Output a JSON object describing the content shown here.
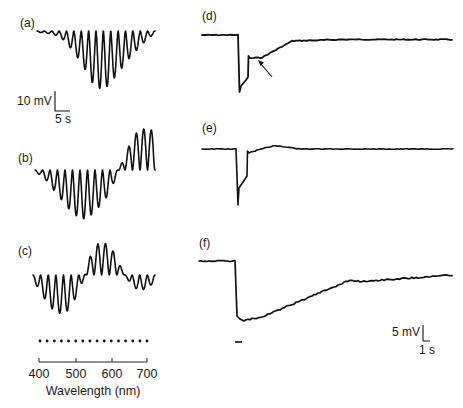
{
  "chart_data": [
    {
      "type": "line",
      "panel": "a",
      "title": "(a)",
      "description": "Membrane potential response to flashes of wavelength stepped 400-700 nm; hyperpolarizing responses peaking mid-spectrum",
      "xlabel": "Wavelength (nm)",
      "ylabel": "",
      "x": [
        400,
        420,
        440,
        460,
        480,
        500,
        520,
        540,
        560,
        580,
        600,
        620,
        640,
        660,
        680,
        700
      ],
      "values": [
        -0.5,
        -1,
        -1.5,
        -3,
        -7,
        -12,
        -18,
        -25,
        -28,
        -27,
        -22,
        -17,
        -12,
        -8,
        -4,
        -1
      ],
      "units": "mV"
    },
    {
      "type": "line",
      "panel": "b",
      "title": "(b)",
      "description": "Biphasic response: hyperpolarizing at short wavelengths, depolarizing at long wavelengths",
      "x": [
        400,
        420,
        440,
        460,
        480,
        500,
        520,
        540,
        560,
        580,
        600,
        620,
        640,
        660,
        680,
        700
      ],
      "values": [
        -1,
        -3,
        -8,
        -13,
        -18,
        -22,
        -24,
        -22,
        -18,
        -13,
        -5,
        5,
        14,
        20,
        20,
        19
      ],
      "units": "mV"
    },
    {
      "type": "line",
      "panel": "c",
      "title": "(c)",
      "description": "Triphasic response: hyperpolarizing (blue), depolarizing (green), hyperpolarizing (red)",
      "x": [
        400,
        420,
        440,
        460,
        480,
        500,
        520,
        540,
        560,
        580,
        600,
        620,
        640,
        660,
        680,
        700
      ],
      "values": [
        -2,
        -8,
        -14,
        -17,
        -17,
        -12,
        -4,
        8,
        14,
        14,
        10,
        2,
        -4,
        -7,
        -6,
        -3
      ],
      "units": "mV"
    },
    {
      "type": "line",
      "panel": "d",
      "title": "(d)",
      "description": "Time-course trace: fast hyperpolarizing transient followed by slower component (arrow), returning to baseline",
      "annotation": "arrow marking slow component"
    },
    {
      "type": "line",
      "panel": "e",
      "title": "(e)",
      "description": "Time-course trace: fast hyperpolarizing transient returning rapidly to baseline"
    },
    {
      "type": "line",
      "panel": "f",
      "title": "(f)",
      "description": "Time-course trace: sustained hyperpolarization with slow recovery; stimulus bar below onset"
    }
  ],
  "labels": {
    "a": "(a)",
    "b": "(b)",
    "c": "(c)",
    "d": "(d)",
    "e": "(e)",
    "f": "(f)"
  },
  "scale_left": {
    "voltage": "10 mV",
    "time": "5 s"
  },
  "scale_right": {
    "voltage": "5 mV",
    "time": "1 s"
  },
  "axis": {
    "ticks": [
      "400",
      "500",
      "600",
      "700"
    ],
    "label": "Wavelength (nm)"
  },
  "stimulus_dots": 16,
  "colors": {
    "trace": "#111111",
    "background": "#ffffff"
  }
}
